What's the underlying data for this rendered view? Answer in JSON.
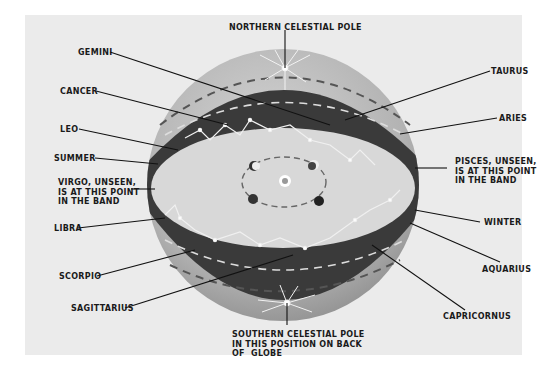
{
  "diagram": {
    "colors": {
      "background": "#ebebeb",
      "globe_light": "#c9c9c9",
      "globe_dark": "#9a9a9a",
      "band": "#3a3a3a",
      "inner": "#dcdcdc",
      "star": "#ffffff",
      "leader": "#111111"
    },
    "labels": {
      "north_pole": "NORTHERN CELESTIAL POLE",
      "gemini": "GEMINI",
      "cancer": "CANCER",
      "leo": "LEO",
      "summer": "SUMMER",
      "virgo": "VIRGO, UNSEEN,\nIS AT THIS POINT\nIN THE BAND",
      "libra": "LIBRA",
      "scorpio": "SCORPIO",
      "sagittarius": "SAGITTARIUS",
      "south_pole": "SOUTHERN CELESTIAL POLE\nIN THIS POSITION ON BACK\nOF  GLOBE",
      "taurus": "TAURUS",
      "aries": "ARIES",
      "pisces": "PISCES, UNSEEN,\nIS AT THIS POINT\nIN THE BAND",
      "winter": "WINTER",
      "aquarius": "AQUARIUS",
      "capricornus": "CAPRICORNUS"
    },
    "center": {
      "sun": "sun-icon",
      "earth_positions": 4
    }
  }
}
